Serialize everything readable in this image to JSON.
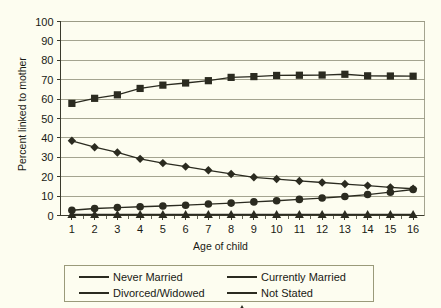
{
  "chart_data": {
    "type": "line",
    "title": "",
    "xlabel": "Age of child",
    "ylabel": "Percent linked to mother",
    "x": [
      1,
      2,
      3,
      4,
      5,
      6,
      7,
      8,
      9,
      10,
      11,
      12,
      13,
      14,
      15,
      16
    ],
    "categories": [
      "1",
      "2",
      "3",
      "4",
      "5",
      "6",
      "7",
      "8",
      "9",
      "10",
      "11",
      "12",
      "13",
      "14",
      "15",
      "16"
    ],
    "xlim": [
      0.5,
      16.5
    ],
    "ylim": [
      0,
      100
    ],
    "yticks": [
      0,
      10,
      20,
      30,
      40,
      50,
      60,
      70,
      80,
      90,
      100
    ],
    "ytick_labels": [
      "0",
      "10",
      "20",
      "30",
      "40",
      "50",
      "60",
      "70",
      "80",
      "90",
      "100"
    ],
    "grid": "horizontal",
    "legend_position": "bottom",
    "series": [
      {
        "name": "Never Married",
        "marker": "diamond",
        "values": [
          38.5,
          35.2,
          32.5,
          29.2,
          27.0,
          25.2,
          23.3,
          21.4,
          19.7,
          18.8,
          17.8,
          17.0,
          16.2,
          15.4,
          14.5,
          13.8
        ]
      },
      {
        "name": "Currently Married",
        "marker": "square",
        "values": [
          57.8,
          60.4,
          62.2,
          65.5,
          67.2,
          68.3,
          69.5,
          71.2,
          71.6,
          72.2,
          72.3,
          72.4,
          72.8,
          72.0,
          71.9,
          71.8
        ]
      },
      {
        "name": "Divorced/Widowed",
        "marker": "circle",
        "values": [
          2.7,
          3.6,
          4.1,
          4.5,
          4.9,
          5.3,
          5.9,
          6.4,
          7.0,
          7.6,
          8.3,
          9.0,
          9.8,
          10.8,
          12.0,
          13.4
        ]
      },
      {
        "name": "Not Stated",
        "marker": "triangle",
        "values": [
          0.6,
          0.6,
          0.6,
          0.6,
          0.6,
          0.6,
          0.6,
          0.6,
          0.6,
          0.6,
          0.6,
          0.6,
          0.6,
          0.6,
          0.6,
          0.6
        ]
      }
    ]
  },
  "legend": {
    "entries": [
      {
        "label": "Never Married",
        "marker": "diamond"
      },
      {
        "label": "Currently Married",
        "marker": "square"
      },
      {
        "label": "Divorced/Widowed",
        "marker": "circle"
      },
      {
        "label": "Not Stated",
        "marker": "triangle"
      }
    ]
  },
  "colors": {
    "background": "#FDFDF0",
    "series": "#2b2b20",
    "grid": "#9a9a85",
    "axis": "#3a3a2c",
    "legend_border": "#9a9a7a"
  }
}
